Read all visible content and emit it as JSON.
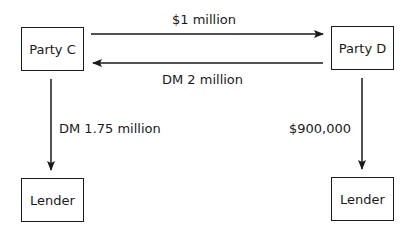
{
  "nodes": {
    "party_c": {
      "label": "Party C"
    },
    "party_d": {
      "label": "Party D"
    },
    "lender_left": {
      "label": "Lender"
    },
    "lender_right": {
      "label": "Lender"
    }
  },
  "edges": {
    "c_to_d": {
      "label": "$1 million"
    },
    "d_to_c": {
      "label": "DM 2 million"
    },
    "c_to_lender": {
      "label": "DM 1.75 million"
    },
    "d_to_lender": {
      "label": "$900,000"
    }
  },
  "colors": {
    "stroke": "#1a1a1a",
    "background": "#ffffff"
  }
}
